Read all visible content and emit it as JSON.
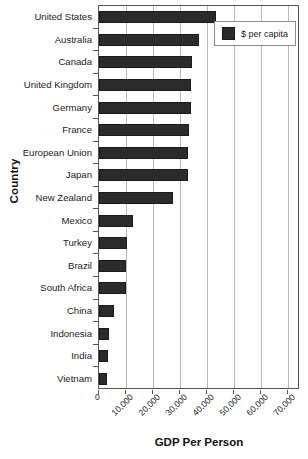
{
  "chart_data": {
    "type": "bar",
    "orientation": "horizontal",
    "title": "",
    "xlabel": "GDP Per Person",
    "ylabel": "Country",
    "categories": [
      "United States",
      "Australia",
      "Canada",
      "United Kingdom",
      "Germany",
      "France",
      "European Union",
      "Japan",
      "New Zealand",
      "Mexico",
      "Turkey",
      "Brazil",
      "South Africa",
      "China",
      "Indonesia",
      "India",
      "Vietnam"
    ],
    "values": [
      43500,
      37000,
      34500,
      34000,
      34000,
      33500,
      33000,
      33000,
      27500,
      12500,
      10500,
      10000,
      10000,
      5500,
      3800,
      3200,
      3000
    ],
    "series": [
      {
        "name": "$ per capita",
        "values": [
          43500,
          37000,
          34500,
          34000,
          34000,
          33500,
          33000,
          33000,
          27500,
          12500,
          10500,
          10000,
          10000,
          5500,
          3800,
          3200,
          3000
        ]
      }
    ],
    "xticks": [
      0,
      10000,
      20000,
      30000,
      40000,
      50000,
      60000,
      70000
    ],
    "xtick_labels": [
      "0",
      "10,000",
      "20,000",
      "30,000",
      "40,000",
      "50,000",
      "60,000",
      "70,000"
    ],
    "xlim": [
      0,
      74500
    ],
    "grid": true,
    "legend": {
      "position": "top-right",
      "entries": [
        {
          "label": "$ per capita",
          "color": "#2b2b2b"
        }
      ]
    },
    "colors": {
      "bar": "#2b2b2b",
      "bar_edge": "#1b1b1b",
      "grid": "#b9b9b9",
      "axis": "#555555",
      "text": "#1c1c1c",
      "background": "#ffffff"
    }
  }
}
